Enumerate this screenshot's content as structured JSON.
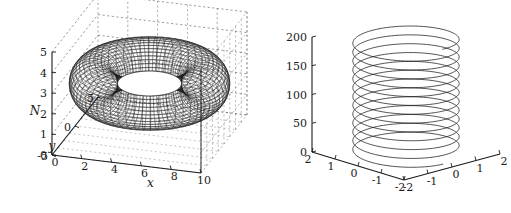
{
  "figure": {
    "background_color": "#ffffff",
    "ink_color": "#1a1a1a",
    "panel_count": 2
  },
  "chart_data": [
    {
      "type": "line",
      "subtype": "surface-mesh-3d",
      "title": "",
      "object": "torus",
      "description": "Dense dark wireframe torus (donut) rendered as a 3-D mesh surface on a boxed axis with dashed background gridlines",
      "projection": "3d-axonometric",
      "xlabel": "x",
      "ylabel": "y",
      "zlabel": "N",
      "xticks": [
        0,
        2,
        4,
        6,
        8,
        10
      ],
      "xticklabels": [
        "0",
        "2",
        "4",
        "6",
        "8",
        "10"
      ],
      "yticks": [
        -5,
        0,
        5
      ],
      "yticklabels": [
        "-5",
        "0",
        "5"
      ],
      "zticks": [
        0,
        1,
        2,
        3,
        4,
        5
      ],
      "zticklabels": [
        "0",
        "1",
        "2",
        "3",
        "4",
        "5"
      ],
      "xlim": [
        0,
        10
      ],
      "ylim": [
        -5,
        5
      ],
      "zlim": [
        0,
        5
      ],
      "grid": true,
      "grid_style": "dashed",
      "legend": "none",
      "mesh": {
        "u_lines": 60,
        "v_lines": 40,
        "major_radius": 3.6,
        "minor_radius": 1.55,
        "center_x": 5,
        "center_y": 0,
        "center_z": 2.5
      }
    },
    {
      "type": "line",
      "subtype": "helix-3d",
      "title": "",
      "object": "helix",
      "description": "Single 3-D parametric helix curve of constant radius winding upward about 13 turns",
      "projection": "3d-axonometric",
      "xlabel": "",
      "ylabel": "",
      "zlabel": "",
      "xticks": [
        -2,
        -1,
        0,
        1,
        2
      ],
      "xticklabels": [
        "-2",
        "-1",
        "0",
        "1",
        "2"
      ],
      "yticks": [
        -2,
        -1,
        0,
        1,
        2
      ],
      "yticklabels": [
        "2",
        "1",
        "0",
        "-1",
        "-2"
      ],
      "zticks": [
        0,
        50,
        100,
        150,
        200
      ],
      "zticklabels": [
        "0",
        "50",
        "100",
        "150",
        "200"
      ],
      "xlim": [
        -2,
        2
      ],
      "ylim": [
        -2,
        2
      ],
      "zlim": [
        0,
        200
      ],
      "grid": false,
      "legend": "none",
      "helix": {
        "turns": 13,
        "radius": 1.6,
        "z_start": 0,
        "z_end": 200,
        "samples": 1600
      }
    }
  ]
}
